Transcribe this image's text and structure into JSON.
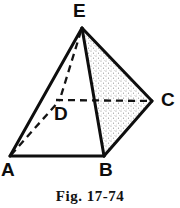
{
  "figure": {
    "caption": "Fig. 17-74",
    "background_color": "#ffffff",
    "ink_color": "#111111",
    "shade_color": "#8a8a8a",
    "labels": {
      "apex": "E",
      "base_front_left": "A",
      "base_front_right": "B",
      "base_right": "C",
      "base_hidden_back": "D"
    },
    "geometry": {
      "shape": "square-pyramid",
      "vertices": {
        "E": [
          82,
          28
        ],
        "A": [
          10,
          156
        ],
        "B": [
          104,
          156
        ],
        "C": [
          152,
          101
        ],
        "D": [
          60,
          100
        ]
      },
      "solid_edges": [
        "E-A",
        "E-B",
        "E-C",
        "A-B",
        "B-C"
      ],
      "dashed_edges": [
        "E-D",
        "A-D",
        "D-C"
      ],
      "shaded_faces": [
        "E-B-C"
      ]
    }
  }
}
